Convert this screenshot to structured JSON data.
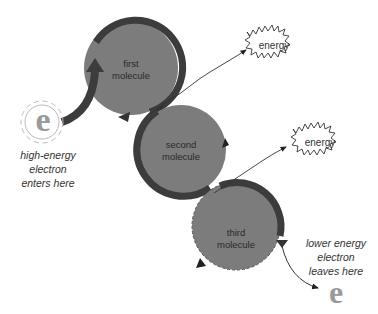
{
  "diagram": {
    "molecules": [
      {
        "label_line1": "first",
        "label_line2": "molecule"
      },
      {
        "label_line1": "second",
        "label_line2": "molecule"
      },
      {
        "label_line1": "third",
        "label_line2": "molecule"
      }
    ],
    "energy_bursts": [
      {
        "label": "energy"
      },
      {
        "label": "energy"
      }
    ],
    "electron_in": {
      "symbol": "e",
      "caption_line1": "high-energy",
      "caption_line2": "electron",
      "caption_line3": "enters here"
    },
    "electron_out": {
      "symbol": "e",
      "caption_line1": "lower energy",
      "caption_line2": "electron",
      "caption_line3": "leaves here"
    },
    "colors": {
      "molecule_fill": "#7c7c7c",
      "ring": "#3c3c3c",
      "electron": "#9a9a9a",
      "text": "#2a2a2a"
    }
  }
}
